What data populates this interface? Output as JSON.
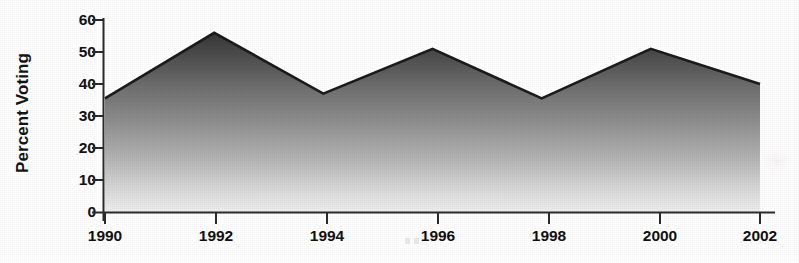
{
  "chart_data": {
    "type": "area",
    "title": "",
    "subtitle": "",
    "xlabel": "",
    "ylabel": "Percent Voting",
    "categories": [
      "1990",
      "1992",
      "1994",
      "1996",
      "1998",
      "2000",
      "2002"
    ],
    "x": [
      1990,
      1992,
      1994,
      1996,
      1998,
      2000,
      2002
    ],
    "values": [
      35.5,
      56,
      37,
      51,
      35.5,
      51,
      40
    ],
    "series": [
      {
        "name": "Percent Voting",
        "values": [
          35.5,
          56,
          37,
          51,
          35.5,
          51,
          40
        ]
      }
    ],
    "xlim": [
      1990,
      2002
    ],
    "ylim": [
      0,
      60
    ],
    "ytick_labels": [
      "0",
      "10",
      "20",
      "30",
      "40",
      "50",
      "60"
    ],
    "ytick_values": [
      0,
      10,
      20,
      30,
      40,
      50,
      60
    ],
    "xtick_labels": [
      "1990",
      "1992",
      "1994",
      "1996",
      "1998",
      "2000",
      "2002"
    ],
    "grid": false,
    "legend": "none",
    "annotations": [],
    "fill_style": "vertical gradient, dark gray at top to near-white at bottom",
    "colors": {
      "fill_top": "#3a3a3a",
      "fill_bottom": "#efefef",
      "edge_line": "#1c1c1c",
      "axis_line": "#2b2b2b",
      "text": "#111111",
      "background": "#ffffff"
    }
  },
  "axes": {
    "y_title": "Percent Voting",
    "y_ticks": [
      {
        "label": "60",
        "value": 60
      },
      {
        "label": "50",
        "value": 50
      },
      {
        "label": "40",
        "value": 40
      },
      {
        "label": "30",
        "value": 30
      },
      {
        "label": "20",
        "value": 20
      },
      {
        "label": "10",
        "value": 10
      },
      {
        "label": "0",
        "value": 0
      }
    ],
    "x_ticks": [
      {
        "label": "1990",
        "value": 1990
      },
      {
        "label": "1992",
        "value": 1992
      },
      {
        "label": "1994",
        "value": 1994
      },
      {
        "label": "1996",
        "value": 1996
      },
      {
        "label": "1998",
        "value": 1998
      },
      {
        "label": "2000",
        "value": 2000
      },
      {
        "label": "2002",
        "value": 2002
      }
    ]
  }
}
